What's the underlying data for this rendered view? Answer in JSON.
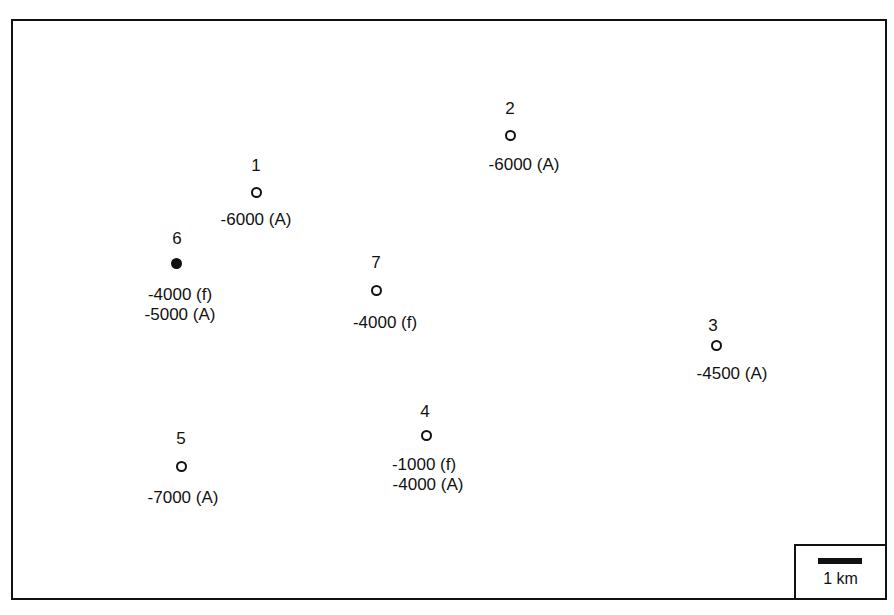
{
  "map": {
    "sites": [
      {
        "id": "1",
        "x": 256,
        "y": 192,
        "filled": false,
        "lines": [
          "-6000 (A)"
        ]
      },
      {
        "id": "2",
        "x": 510,
        "y": 135,
        "filled": false,
        "lines": [
          "-6000 (A)"
        ]
      },
      {
        "id": "3",
        "x": 716,
        "y": 345,
        "filled": false,
        "lines": [
          "-4500 (A)"
        ]
      },
      {
        "id": "4",
        "x": 426,
        "y": 435,
        "filled": false,
        "lines": [
          "-1000 (f)",
          "-4000 (A)"
        ]
      },
      {
        "id": "5",
        "x": 181,
        "y": 466,
        "filled": false,
        "lines": [
          "-7000 (A)"
        ]
      },
      {
        "id": "6",
        "x": 176,
        "y": 263,
        "filled": true,
        "lines": [
          "-4000 (f)",
          "-5000 (A)"
        ]
      },
      {
        "id": "7",
        "x": 376,
        "y": 290,
        "filled": false,
        "lines": [
          "-4000 (f)"
        ]
      }
    ],
    "scale_bar": {
      "label": "1 km"
    }
  }
}
